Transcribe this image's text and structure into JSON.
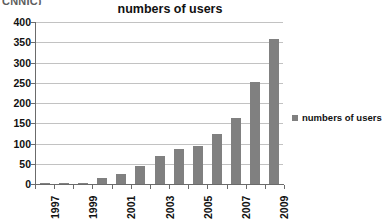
{
  "source_caption": "CNNIC)",
  "legend": {
    "position": "right",
    "entries": [
      "numbers of users"
    ]
  },
  "chart_data": {
    "type": "bar",
    "title": "numbers of users",
    "xlabel": "",
    "ylabel": "",
    "categories": [
      "1997",
      "1998",
      "1999",
      "2000",
      "2001",
      "2002",
      "2003",
      "2004",
      "2005",
      "2006",
      "2007",
      "2008",
      "2009"
    ],
    "tick_labels_shown": [
      "1997",
      "",
      "1999",
      "",
      "2001",
      "",
      "2003",
      "",
      "2005",
      "",
      "2007",
      "",
      "2009"
    ],
    "values": [
      0.6,
      1,
      3,
      15,
      25,
      45,
      68,
      87,
      94,
      123,
      162,
      253,
      358
    ],
    "series": [
      {
        "name": "numbers of users",
        "values": [
          0.6,
          1,
          3,
          15,
          25,
          45,
          68,
          87,
          94,
          123,
          162,
          253,
          358
        ],
        "color": "#808080"
      }
    ],
    "ylim": [
      0,
      400
    ],
    "yticks": [
      0,
      50,
      100,
      150,
      200,
      250,
      300,
      350,
      400
    ],
    "ytick_labels": [
      "0",
      "50",
      "100",
      "150",
      "200",
      "250",
      "300",
      "350",
      "400"
    ],
    "grid": true,
    "grid_axis": "y",
    "xtick_label_rotation": 90,
    "legend_position": "right",
    "colors": {
      "bar": "#808080",
      "grid": "#c2c2c2",
      "axis": "#6b6b6b",
      "text": "#111111",
      "background": "#ffffff"
    }
  }
}
